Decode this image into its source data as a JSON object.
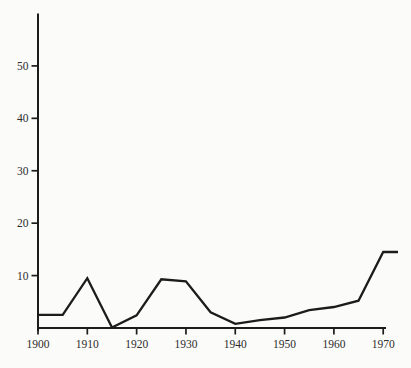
{
  "chart_data": {
    "type": "line",
    "title": "",
    "subtitle": "",
    "xlabel": "",
    "ylabel": "",
    "x": [
      1900,
      1905,
      1910,
      1915,
      1920,
      1925,
      1930,
      1935,
      1940,
      1945,
      1950,
      1955,
      1960,
      1965,
      1970,
      1973
    ],
    "values": [
      2.5,
      2.5,
      9.5,
      0.1,
      2.4,
      9.3,
      8.9,
      3.0,
      0.8,
      1.5,
      2.0,
      3.4,
      4.0,
      5.2,
      14.5,
      14.5
    ],
    "x_ticks": [
      1900,
      1910,
      1920,
      1930,
      1940,
      1950,
      1960,
      1970
    ],
    "y_ticks": [
      10,
      20,
      30,
      40,
      50
    ],
    "xlim": [
      1900,
      1973
    ],
    "ylim": [
      0,
      60
    ],
    "grid": false,
    "legend": null,
    "line_color": "#1c1c1c",
    "axis_color": "#1c1c1c",
    "label_color": "#2b2b2b",
    "background_color": "#fbfbf9"
  }
}
